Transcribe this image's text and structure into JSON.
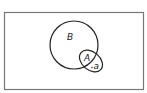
{
  "diagram": {
    "type": "venn",
    "frame": {
      "x": 4,
      "y": 12,
      "width": 139,
      "height": 77,
      "stroke": "#777777"
    },
    "sets": [
      {
        "id": "B",
        "label": "B",
        "shape": "circle",
        "cx": 74,
        "cy": 45,
        "r": 24
      },
      {
        "id": "A",
        "label": "A",
        "shape": "ellipse",
        "cx": 91,
        "cy": 61,
        "rx": 13,
        "ry": 9,
        "rotation": 40
      }
    ],
    "elements": [
      {
        "label": "a",
        "set": "A",
        "outside": "B"
      }
    ],
    "stroke_color": "#222222"
  }
}
